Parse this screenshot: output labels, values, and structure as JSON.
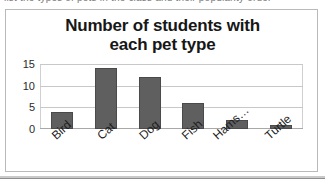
{
  "page": {
    "scan_fragment": "list the types of pets in the class and their popularity order"
  },
  "chart_data": {
    "type": "bar",
    "title": "Number of students with each pet type",
    "title_line1": "Number of students with",
    "title_line2": "each pet type",
    "categories": [
      "Bird",
      "Cat",
      "Dog",
      "Fish",
      "Hams…",
      "Turtle"
    ],
    "values": [
      4,
      14,
      12,
      6,
      2,
      1
    ],
    "xlabel": "",
    "ylabel": "",
    "ylim": [
      0,
      15
    ],
    "yticks": [
      15,
      10,
      5,
      0
    ],
    "grid": true,
    "legend": false,
    "bar_color": "#5f5f5f",
    "gridline_color": "#c8c8c8",
    "text_color": "#1d1d1d"
  }
}
